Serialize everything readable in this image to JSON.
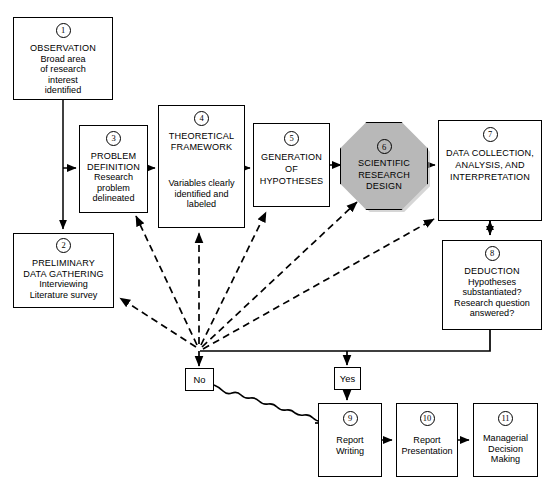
{
  "diagram": {
    "type": "flowchart",
    "nodes": [
      {
        "id": "1",
        "number": "1",
        "heading": "OBSERVATION",
        "lines": [
          "Broad area",
          "of research",
          "interest",
          "identified"
        ]
      },
      {
        "id": "2",
        "number": "2",
        "heading": "PRELIMINARY\nDATA GATHERING",
        "lines": [
          "Interviewing",
          "Literature survey"
        ]
      },
      {
        "id": "3",
        "number": "3",
        "heading": "PROBLEM\nDEFINITION",
        "lines": [
          "Research",
          "problem",
          "delineated"
        ]
      },
      {
        "id": "4",
        "number": "4",
        "heading": "THEORETICAL\nFRAMEWORK",
        "lines": [
          "Variables clearly",
          "identified and",
          "labeled"
        ]
      },
      {
        "id": "5",
        "number": "5",
        "heading": "GENERATION\nOF\nHYPOTHESES",
        "lines": []
      },
      {
        "id": "6",
        "number": "6",
        "heading": "SCIENTIFIC\nRESEARCH\nDESIGN",
        "lines": [],
        "shape": "octagon",
        "fill": "#b8b8b8"
      },
      {
        "id": "7",
        "number": "7",
        "heading": "DATA COLLECTION,\nANALYSIS, AND\nINTERPRETATION",
        "lines": []
      },
      {
        "id": "8",
        "number": "8",
        "heading": "DEDUCTION",
        "lines": [
          "Hypotheses",
          "substantiated?",
          "Research question",
          "answered?"
        ]
      },
      {
        "id": "9",
        "number": "9",
        "heading": "",
        "lines": [
          "Report",
          "Writing"
        ]
      },
      {
        "id": "10",
        "number": "10",
        "heading": "",
        "lines": [
          "Report",
          "Presentation"
        ]
      },
      {
        "id": "11",
        "number": "11",
        "heading": "",
        "lines": [
          "Managerial",
          "Decision",
          "Making"
        ]
      }
    ],
    "decisions": {
      "no_label": "No",
      "yes_label": "Yes"
    },
    "colors": {
      "stroke": "#000000",
      "background": "#ffffff",
      "octagon_fill": "#b8b8b8",
      "octagon_shadow": "#b5b5b5"
    },
    "edges": [
      {
        "from": "1",
        "to": "3",
        "style": "solid"
      },
      {
        "from": "1",
        "to": "2",
        "style": "solid"
      },
      {
        "from": "3",
        "to": "4",
        "style": "solid"
      },
      {
        "from": "4",
        "to": "5",
        "style": "solid"
      },
      {
        "from": "5",
        "to": "6",
        "style": "solid"
      },
      {
        "from": "6",
        "to": "7",
        "style": "solid"
      },
      {
        "from": "7",
        "to": "8",
        "style": "solid-bidirectional"
      },
      {
        "from": "8",
        "to": "decision",
        "style": "solid"
      },
      {
        "from": "decision",
        "to": "No",
        "style": "solid"
      },
      {
        "from": "decision",
        "to": "Yes",
        "style": "solid"
      },
      {
        "from": "feedback",
        "to": "2",
        "style": "dashed"
      },
      {
        "from": "feedback",
        "to": "3",
        "style": "dashed"
      },
      {
        "from": "feedback",
        "to": "4",
        "style": "dashed"
      },
      {
        "from": "feedback",
        "to": "5",
        "style": "dashed"
      },
      {
        "from": "feedback",
        "to": "6",
        "style": "dashed"
      },
      {
        "from": "feedback",
        "to": "7",
        "style": "dashed"
      },
      {
        "from": "No",
        "to": "9",
        "style": "wavy"
      },
      {
        "from": "Yes",
        "to": "9",
        "style": "solid"
      },
      {
        "from": "9",
        "to": "10",
        "style": "solid"
      },
      {
        "from": "10",
        "to": "11",
        "style": "solid"
      }
    ]
  }
}
